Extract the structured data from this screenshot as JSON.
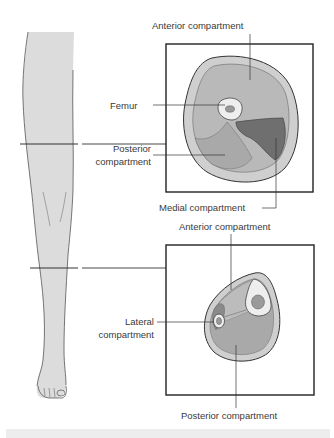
{
  "figure": {
    "colors": {
      "skin": "#d6d6d6",
      "subcutaneous": "#cfcfcf",
      "muscle_light": "#b7b7b7",
      "muscle_mid": "#a8a8a8",
      "muscle_dark": "#6e6e6e",
      "bone": "#eeeeee",
      "marrow": "#9a9a9a",
      "outline": "#333333",
      "leg_fill": "#dcdcdc",
      "frame": "#222222"
    }
  },
  "thigh_section": {
    "labels": {
      "anterior": "Anterior compartment",
      "femur": "Femur",
      "posterior_line1": "Posterior",
      "posterior_line2": "compartment",
      "medial": "Medial compartment"
    }
  },
  "lower_leg_section": {
    "labels": {
      "anterior": "Anterior compartment",
      "lateral_line1": "Lateral",
      "lateral_line2": "compartment",
      "posterior": "Posterior compartment"
    }
  }
}
